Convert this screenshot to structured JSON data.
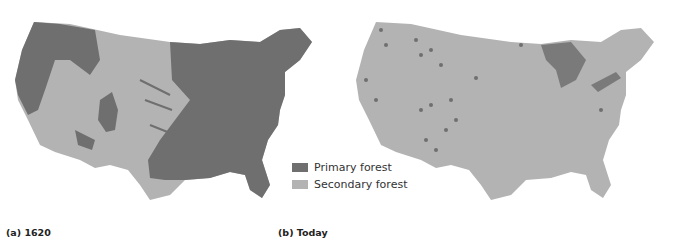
{
  "colors": {
    "primary_forest": "#6f6f6f",
    "secondary_forest": "#b3b3b3",
    "background": "#ffffff",
    "caption_text": "#222222"
  },
  "maps": [
    {
      "id": "a",
      "caption": "(a) 1620",
      "subject": "Forest cover of contiguous United States, 1620"
    },
    {
      "id": "b",
      "caption": "(b) Today",
      "subject": "Forest cover of contiguous United States, today"
    }
  ],
  "legend": {
    "items": [
      {
        "label": "Primary forest",
        "color": "#6f6f6f"
      },
      {
        "label": "Secondary forest",
        "color": "#b3b3b3"
      }
    ]
  }
}
